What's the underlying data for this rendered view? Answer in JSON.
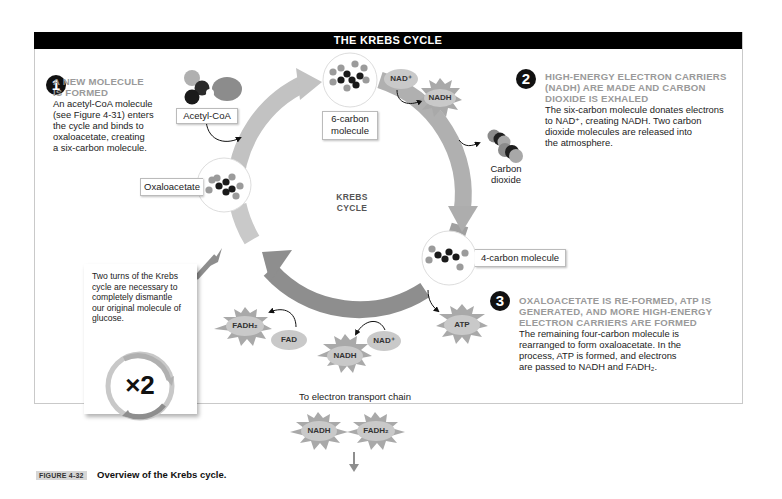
{
  "figure": {
    "title": "THE KREBS CYCLE",
    "caption_tag": "FIGURE 4-32",
    "caption_text": "Overview of the Krebs cycle."
  },
  "steps": [
    {
      "number": "1",
      "heading_line1": "A NEW MOLECULE",
      "heading_line2": "IS FORMED",
      "body_lines": [
        "An acetyl-CoA molecule",
        "(see Figure 4-31) enters",
        "the cycle and binds to",
        "oxaloacetate, creating",
        "a six-carbon molecule."
      ]
    },
    {
      "number": "2",
      "heading_line1": "HIGH-ENERGY ELECTRON CARRIERS",
      "heading_line2": "(NADH) ARE MADE AND CARBON",
      "heading_line3": "DIOXIDE IS EXHALED",
      "body_lines": [
        "The six-carbon molecule donates electrons",
        "to NAD⁺, creating NADH.  Two carbon",
        "dioxide molecules are released into",
        "the atmosphere."
      ]
    },
    {
      "number": "3",
      "heading_line1": "OXALOACETATE IS RE-FORMED, ATP IS",
      "heading_line2": "GENERATED, AND MORE HIGH-ENERGY",
      "heading_line3": "ELECTRON CARRIERS ARE FORMED",
      "body_lines": [
        "The remaining four-carbon molecule is",
        "rearranged to form oxaloacetate. In the",
        "process, ATP is formed, and electrons",
        "are passed to NADH and FADH₂."
      ]
    }
  ],
  "cycle": {
    "center_line1": "KREBS",
    "center_line2": "CYCLE",
    "molecules": {
      "acetyl_coa": "Acetyl-CoA",
      "six_carbon_line1": "6-carbon",
      "six_carbon_line2": "molecule",
      "carbon_dioxide_line1": "Carbon",
      "carbon_dioxide_line2": "dioxide",
      "four_carbon": "4-carbon molecule",
      "oxaloacetate": "Oxaloacetate"
    },
    "carriers": {
      "nad_plus_top": "NAD⁺",
      "nadh_top": "NADH",
      "atp": "ATP",
      "nad_plus_bottom": "NAD⁺",
      "nadh_bottom": "NADH",
      "fad": "FAD",
      "fadh2": "FADH₂"
    }
  },
  "two_turns_note": {
    "lines": [
      "Two turns of the Krebs",
      "cycle are necessary to",
      "completely dismantle",
      "our original molecule of",
      "glucose."
    ],
    "multiplier": "×2"
  },
  "electron_transport": {
    "label": "To electron transport chain",
    "items": [
      "NADH",
      "FADH₂"
    ]
  },
  "colors": {
    "cycle_arrow_light": "#bdbdbd",
    "cycle_arrow_dark": "#8a8a8a",
    "dark_atom": "#1a1a1a",
    "gray_atom": "#9b9b9b",
    "burst": "#a9a9a9",
    "pill": "#c9c9c9",
    "heading_gray": "#9a9a9a"
  }
}
